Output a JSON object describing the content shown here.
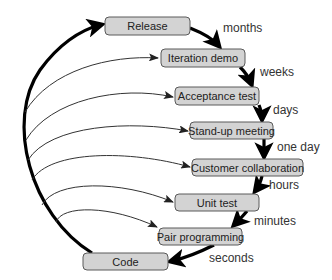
{
  "diagram": {
    "type": "feedback-loops",
    "nodes": [
      {
        "id": "release",
        "label": "Release"
      },
      {
        "id": "iteration-demo",
        "label": "Iteration demo"
      },
      {
        "id": "acceptance-test",
        "label": "Acceptance test"
      },
      {
        "id": "stand-up-meeting",
        "label": "Stand-up meeting"
      },
      {
        "id": "customer-collaboration",
        "label": "Customer collaboration"
      },
      {
        "id": "unit-test",
        "label": "Unit test"
      },
      {
        "id": "pair-programming",
        "label": "Pair programming"
      },
      {
        "id": "code",
        "label": "Code"
      }
    ],
    "timescales": [
      {
        "from": "release",
        "to": "iteration-demo",
        "label": "months"
      },
      {
        "from": "iteration-demo",
        "to": "acceptance-test",
        "label": "weeks"
      },
      {
        "from": "acceptance-test",
        "to": "stand-up-meeting",
        "label": "days"
      },
      {
        "from": "stand-up-meeting",
        "to": "customer-collaboration",
        "label": "one day"
      },
      {
        "from": "customer-collaboration",
        "to": "unit-test",
        "label": "hours"
      },
      {
        "from": "unit-test",
        "to": "pair-programming",
        "label": "minutes"
      },
      {
        "from": "pair-programming",
        "to": "code",
        "label": "seconds"
      }
    ],
    "colors": {
      "box_fill": "#d3d3d3",
      "box_stroke": "#5a5a5a",
      "arrow": "#000000"
    }
  }
}
